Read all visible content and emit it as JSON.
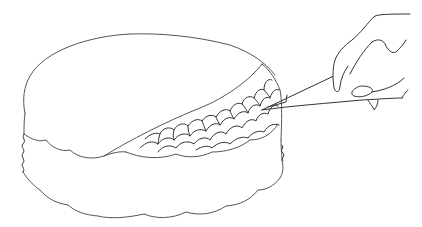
{
  "illustration": {
    "subject": "hand cutting a cake with a knife",
    "style": "line drawing",
    "colors": {
      "background": "#ffffff",
      "stroke": "#555555"
    },
    "elements": [
      "cake-top-layer",
      "cake-bottom-layer",
      "scale-pattern-reveal",
      "knife",
      "hand"
    ]
  }
}
